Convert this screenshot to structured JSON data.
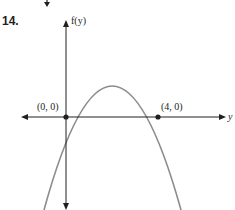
{
  "problem": {
    "number": "14."
  },
  "graph": {
    "vertical_axis_label": "f(y)",
    "horizontal_axis_label": "y",
    "points": [
      {
        "label": "(0, 0)",
        "x": 0,
        "y": 0
      },
      {
        "label": "(4, 0)",
        "x": 4,
        "y": 0
      }
    ],
    "curve": "downward-opening parabola through (0,0) and (4,0)",
    "colors": {
      "axis": "#231f20",
      "curve": "#8c8c8c",
      "point": "#231f20"
    }
  }
}
